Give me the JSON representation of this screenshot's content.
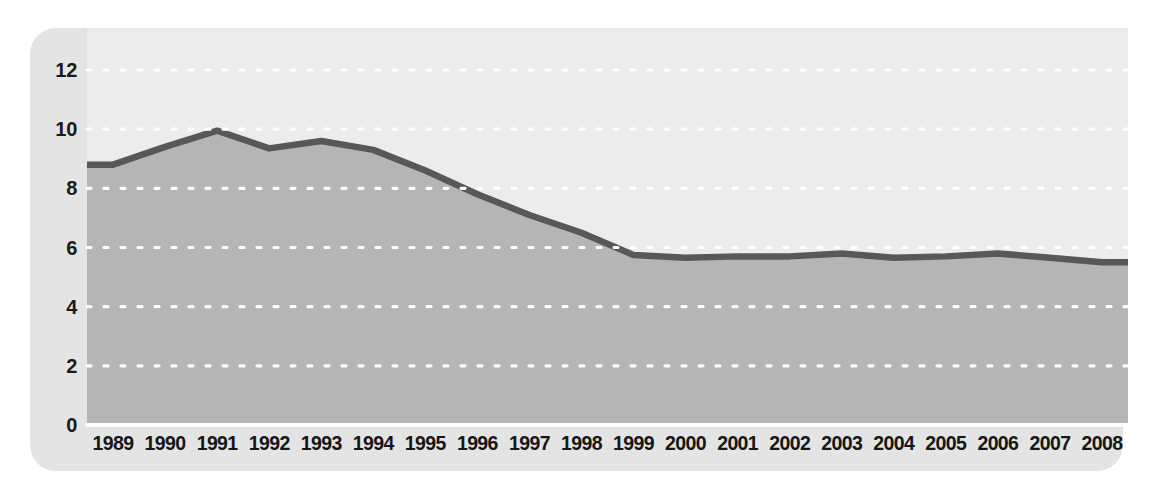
{
  "figure": {
    "panel_background": "#e4e4e4",
    "plot_background": "#ececec",
    "area_fill": "#b5b5b5",
    "line_color": "#585858",
    "gridline_color": "#ffffff",
    "label_color": "#161616"
  },
  "showthrough_text": {
    "line1": "affect its budget for some time. There is an inherent",
    "line2": "ly over a period that could be as long as",
    "line3": "nual internal borrowings to transitional",
    "line4": "other years, requirements for",
    "line5": "ebt interest costs."
  },
  "chart_data": {
    "type": "area",
    "title": "",
    "xlabel": "",
    "ylabel": "",
    "grid": true,
    "legend": "none",
    "ylim": [
      0,
      12
    ],
    "ytick_step": 2,
    "yticks": [
      0,
      2,
      4,
      6,
      8,
      10,
      12
    ],
    "ytick_labels": [
      "0",
      "2",
      "4",
      "6",
      "8",
      "10",
      "12"
    ],
    "categories": [
      "1989",
      "1990",
      "1991",
      "1992",
      "1993",
      "1994",
      "1995",
      "1996",
      "1997",
      "1998",
      "1999",
      "2000",
      "2001",
      "2002",
      "2003",
      "2004",
      "2005",
      "2006",
      "2007",
      "2008"
    ],
    "values": [
      8.8,
      9.4,
      9.95,
      9.35,
      9.6,
      9.3,
      8.6,
      7.8,
      7.1,
      6.5,
      5.75,
      5.65,
      5.7,
      5.7,
      5.8,
      5.65,
      5.7,
      5.8,
      5.65,
      5.5
    ]
  }
}
